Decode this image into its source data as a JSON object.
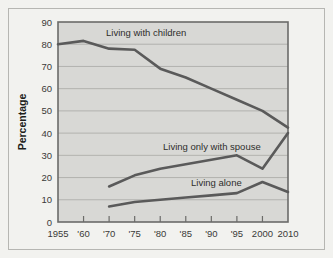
{
  "chart_data": {
    "type": "line",
    "title": "",
    "xlabel": "",
    "ylabel": "Percentage",
    "ylim": [
      0,
      90
    ],
    "ytick_step": 10,
    "grid": true,
    "legend_position": "inline-annotations",
    "background_color": "#d8d8d5",
    "line_color": "#5a5a5a",
    "frame_color": "#6b6b69",
    "categories": [
      "1955",
      "'60",
      "'70",
      "'75",
      "'80",
      "'85",
      "'90",
      "'95",
      "2000",
      "2010"
    ],
    "yticks": [
      "0",
      "10",
      "20",
      "30",
      "40",
      "50",
      "60",
      "70",
      "80",
      "90"
    ],
    "x": [
      1955,
      1960,
      1970,
      1975,
      1980,
      1985,
      1990,
      1995,
      2000,
      2010
    ],
    "series": [
      {
        "name": "Living with children",
        "annotation": "Living with children",
        "values": [
          80,
          81.5,
          78,
          77.5,
          69,
          65,
          60,
          55,
          50,
          42.5
        ]
      },
      {
        "name": "Living only with spouse",
        "annotation": "Living only with spouse",
        "values": [
          null,
          null,
          16,
          21,
          24,
          26,
          28,
          30,
          24,
          40
        ]
      },
      {
        "name": "Living alone",
        "annotation": "Living alone",
        "values": [
          null,
          null,
          7,
          9,
          10,
          11,
          12,
          13,
          18,
          13.5
        ]
      }
    ]
  },
  "annotations": {
    "children_label": "Living with children",
    "spouse_label": "Living only with spouse",
    "alone_label": "Living alone"
  },
  "axes": {
    "y_title": "Percentage"
  }
}
